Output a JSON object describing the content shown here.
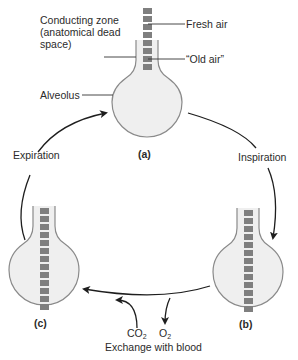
{
  "diagram": {
    "labels": {
      "conducting_zone": "Conducting zone (anatomical dead space)",
      "fresh_air": "Fresh air",
      "old_air": "“Old air”",
      "alveolus": "Alveolus",
      "expiration": "Expiration",
      "inspiration": "Inspiration",
      "exchange": "Exchange with blood"
    },
    "gases": {
      "co2_base": "CO",
      "co2_sub": "2",
      "o2_base": "O",
      "o2_sub": "2"
    },
    "panels": {
      "a": "(a)",
      "b": "(b)",
      "c": "(c)"
    },
    "colors": {
      "bulb_fill": "#efefef",
      "bulb_stroke": "#8a8a8a",
      "air_square": "#7f7f7f",
      "arrow": "#1e1e1e",
      "leader_line": "#333333"
    },
    "square_counts": {
      "a": 8,
      "b": 13,
      "c": 13
    }
  }
}
